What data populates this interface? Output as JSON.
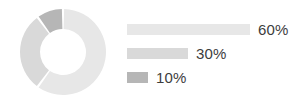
{
  "chart_data": {
    "type": "pie",
    "variant": "donut",
    "title": "",
    "subtitle": "",
    "xlabel": "",
    "ylabel": "",
    "legend_position": "right",
    "grid": false,
    "categories": [
      "60%",
      "30%",
      "10%"
    ],
    "values": [
      60,
      30,
      10
    ],
    "labels": [
      "60%",
      "30%",
      "10%"
    ],
    "slice_colors": [
      "#e7e7e7",
      "#d9d9d9",
      "#b6b6b6"
    ],
    "slices": [
      {
        "label": "60%",
        "value": 60,
        "color": "#e7e7e7",
        "bar_width_px": 123
      },
      {
        "label": "30%",
        "value": 30,
        "color": "#d9d9d9",
        "bar_width_px": 61
      },
      {
        "label": "10%",
        "value": 10,
        "color": "#b6b6b6",
        "bar_width_px": 21
      }
    ],
    "donut": {
      "center_x": 45,
      "center_y": 45,
      "outer_radius": 43,
      "inner_radius": 23,
      "start_angle_deg": 0,
      "gap_deg": 3,
      "background": "#ffffff"
    }
  },
  "legend": {
    "rows": [
      {
        "label": "60%",
        "color": "#e7e7e7",
        "bar_width_px": 123
      },
      {
        "label": "30%",
        "color": "#d9d9d9",
        "bar_width_px": 61
      },
      {
        "label": "10%",
        "color": "#b6b6b6",
        "bar_width_px": 21
      }
    ]
  },
  "colors": {
    "background": "#ffffff",
    "text": "#3d3d3d",
    "slice_light": "#e7e7e7",
    "slice_mid": "#d9d9d9",
    "slice_dark": "#b6b6b6"
  }
}
